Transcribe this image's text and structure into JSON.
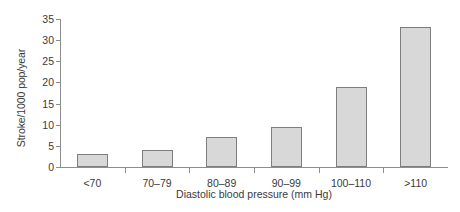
{
  "chart_data": {
    "type": "bar",
    "title": "",
    "subtitle": "",
    "xlabel": "Diastolic blood pressure (mm Hg)",
    "ylabel": "Stroke/1000 pop/year",
    "categories": [
      "<70",
      "70–79",
      "80–89",
      "90–99",
      "100–110",
      ">110"
    ],
    "values": [
      3,
      4,
      7,
      9.5,
      19,
      33
    ],
    "ylim": [
      0,
      35
    ],
    "yticks": [
      0,
      5,
      10,
      15,
      20,
      25,
      30,
      35
    ],
    "ytick_labels": [
      "0",
      "5",
      "10",
      "15",
      "20",
      "25",
      "30",
      "35"
    ],
    "grid": false,
    "legend": null,
    "series": [
      {
        "name": "Stroke incidence",
        "values": [
          3,
          4,
          7,
          9.5,
          19,
          33
        ]
      }
    ],
    "colors": {
      "bar_fill": "#d8d8d8",
      "bar_border": "#7e7e7e",
      "axis": "#8d8d8d",
      "text": "#3a3a3a",
      "background": "#ffffff"
    }
  }
}
